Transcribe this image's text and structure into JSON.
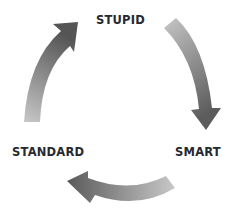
{
  "diagram": {
    "type": "cycle",
    "nodes": [
      {
        "id": "stupid",
        "label": "STUPID"
      },
      {
        "id": "smart",
        "label": "SMART"
      },
      {
        "id": "standard",
        "label": "STANDARD"
      }
    ],
    "edges": [
      {
        "from": "stupid",
        "to": "smart"
      },
      {
        "from": "smart",
        "to": "standard"
      },
      {
        "from": "standard",
        "to": "stupid"
      }
    ],
    "colors": {
      "arrow_dark": "#5a5a5a",
      "arrow_light": "#c4c4c4",
      "text": "#262a30"
    }
  }
}
